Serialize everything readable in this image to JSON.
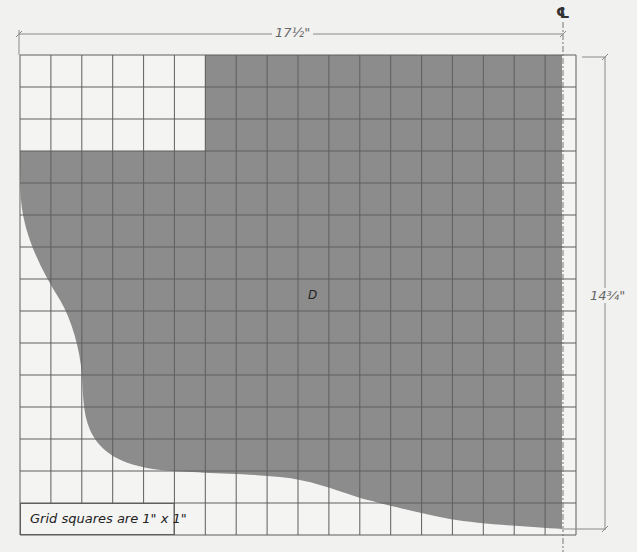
{
  "diagram": {
    "type": "sewing-pattern-grid",
    "piece_label": "D",
    "centerline_symbol": "℄",
    "width_dimension": "17½\"",
    "height_dimension": "14¾\"",
    "caption": "Grid squares are 1\" x 1\"",
    "grid": {
      "columns": 18,
      "rows": 15,
      "cell_size_in": 1,
      "left_px": 20,
      "top_px": 55,
      "right_px": 576,
      "bottom_px": 535
    },
    "colors": {
      "background": "#f1f1f0",
      "grid_fill": "#f4f4f3",
      "grid_line": "#6e6e6e",
      "shaded_fill": "#8c8c8c",
      "dimension_line": "#8a8a8a",
      "text": "#222222"
    }
  }
}
